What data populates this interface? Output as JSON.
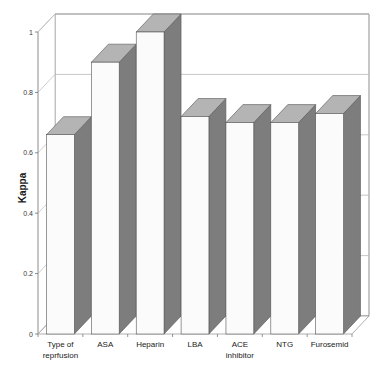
{
  "chart_data": {
    "type": "bar",
    "title": "",
    "subtitle": "",
    "xlabel": "",
    "ylabel": "Kappa",
    "ylim": [
      0,
      1
    ],
    "yticks": [
      "0",
      "0.2",
      "0.4",
      "0.6",
      "0.8",
      "1"
    ],
    "ytick_values": [
      0,
      0.2,
      0.4,
      0.6,
      0.8,
      1
    ],
    "grid": true,
    "legend": "none",
    "style": "3d-column",
    "categories": [
      "Type of reprfusion",
      "ASA",
      "Heparin",
      "LBA",
      "ACE inhibitor",
      "NTG",
      "Furosemid"
    ],
    "category_lines": [
      [
        "Type of",
        "reprfusion"
      ],
      [
        "ASA",
        ""
      ],
      [
        "Heparin",
        ""
      ],
      [
        "LBA",
        ""
      ],
      [
        "ACE",
        "inhibitor"
      ],
      [
        "NTG",
        ""
      ],
      [
        "Furosemid",
        ""
      ]
    ],
    "values": [
      0.66,
      0.9,
      1.0,
      0.72,
      0.7,
      0.7,
      0.73
    ],
    "series": [
      {
        "name": "Kappa",
        "values": [
          0.66,
          0.9,
          1.0,
          0.72,
          0.7,
          0.7,
          0.73
        ]
      }
    ]
  },
  "colors": {
    "bar_front": "#fbfbfb",
    "bar_side": "#7d7d7d",
    "bar_top": "#b4b4b4",
    "bar_outline": "#555555",
    "gridline": "#b9b9b9",
    "axis_line": "#9a9a9a",
    "wall_outline": "#8f8f8f",
    "floor": "#ffffff",
    "background": "#ffffff",
    "text": "#1a1a1a"
  }
}
